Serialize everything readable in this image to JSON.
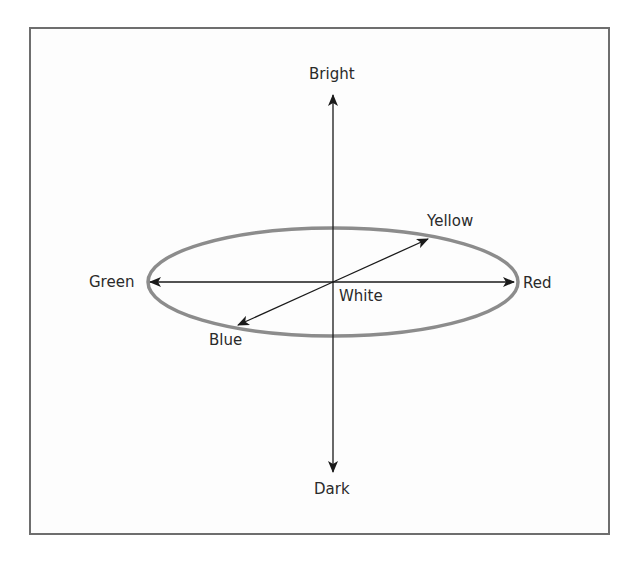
{
  "diagram": {
    "type": "color-opponent-space",
    "colors": {
      "frame": "#6e6e6e",
      "ellipse": "#8c8c8c",
      "axes": "#1a1a1a",
      "text": "#2a2a2a"
    },
    "labels": {
      "bright": "Bright",
      "dark": "Dark",
      "green": "Green",
      "red": "Red",
      "yellow": "Yellow",
      "blue": "Blue",
      "white": "White"
    },
    "axes": [
      {
        "name": "brightness",
        "from": "Dark",
        "to": "Bright"
      },
      {
        "name": "red-green",
        "from": "Green",
        "to": "Red"
      },
      {
        "name": "yellow-blue",
        "from": "Blue",
        "to": "Yellow"
      }
    ],
    "center": "White"
  }
}
